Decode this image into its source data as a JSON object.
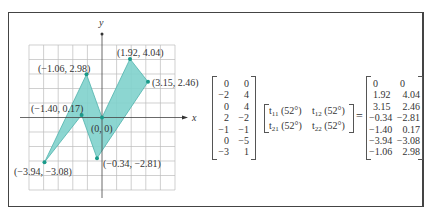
{
  "plot": {
    "x_axis_label": "x",
    "y_axis_label": "y",
    "grid": {
      "xmin": -5,
      "xmax": 5,
      "ymin": -5,
      "ymax": 5,
      "step": 1
    },
    "fill_color": "#7fd1cc",
    "point_color": "#1a9a8a",
    "points": [
      {
        "label": "(0, 0)",
        "x": 0,
        "y": 0
      },
      {
        "label": "(1.92, 4.04)",
        "x": 1.92,
        "y": 4.04
      },
      {
        "label": "(3.15, 2.46)",
        "x": 3.15,
        "y": 2.46
      },
      {
        "label": "(−0.34, −2.81)",
        "x": -0.34,
        "y": -2.81
      },
      {
        "label": "(−1.40, 0.17)",
        "x": -1.4,
        "y": 0.17
      },
      {
        "label": "(−3.94, −3.08)",
        "x": -3.94,
        "y": -3.08
      },
      {
        "label": "(−1.06, 2.98)",
        "x": -1.06,
        "y": 2.98
      }
    ]
  },
  "equation": {
    "input_matrix": [
      [
        "0",
        "0"
      ],
      [
        "−2",
        "4"
      ],
      [
        "0",
        "4"
      ],
      [
        "2",
        "−2"
      ],
      [
        "−1",
        "−1"
      ],
      [
        "0",
        "−5"
      ],
      [
        "−3",
        "1"
      ]
    ],
    "transform_matrix": {
      "t11": "t",
      "t11_sub": "11",
      "t11_arg": "(52°)",
      "t12": "t",
      "t12_sub": "12",
      "t12_arg": "(52°)",
      "t21": "t",
      "t21_sub": "21",
      "t21_arg": "(52°)",
      "t22": "t",
      "t22_sub": "22",
      "t22_arg": "(52°)"
    },
    "equals": "=",
    "output_matrix": [
      [
        "0",
        "0"
      ],
      [
        "1.92",
        "4.04"
      ],
      [
        "3.15",
        "2.46"
      ],
      [
        "−0.34",
        "−2.81"
      ],
      [
        "−1.40",
        "0.17"
      ],
      [
        "−3.94",
        "−3.08"
      ],
      [
        "−1.06",
        "2.98"
      ]
    ]
  }
}
